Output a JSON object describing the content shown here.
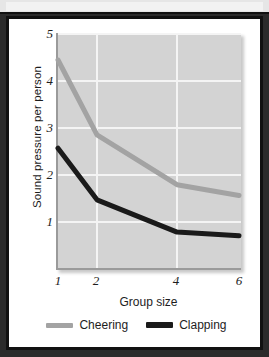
{
  "figure": {
    "background_color": "#2b2b2b",
    "card_color": "#ffffff",
    "frame_color": "#111111"
  },
  "chart_data": {
    "type": "line",
    "title": "",
    "xlabel": "Group size",
    "ylabel": "Sound pressure per person",
    "x": [
      1,
      2,
      4,
      6
    ],
    "xtick_labels": [
      "1",
      "2",
      "4",
      "6"
    ],
    "ytick_labels": [
      "1",
      "2",
      "3",
      "4",
      "5"
    ],
    "ylim": [
      0.35,
      5.35
    ],
    "xlim": [
      0.78,
      6.35
    ],
    "grid": true,
    "grid_color": "#f4f4f4",
    "plot_background": "#d3d3d3",
    "legend_position": "below",
    "series": [
      {
        "name": "Cheering",
        "color": "#a3a3a3",
        "values": [
          4.78,
          3.2,
          2.15,
          1.92
        ]
      },
      {
        "name": "Clapping",
        "color": "#1a1a1a",
        "values": [
          2.92,
          1.83,
          1.15,
          1.07
        ]
      }
    ]
  }
}
